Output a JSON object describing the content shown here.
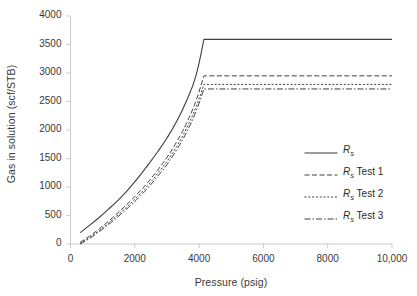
{
  "chart_data": {
    "type": "line",
    "title": "",
    "xlabel": "Pressure (psig)",
    "ylabel": "Gas in solution (scf/STB)",
    "xlim": [
      0,
      10000
    ],
    "ylim": [
      0,
      4000
    ],
    "xticks": [
      0,
      2000,
      4000,
      6000,
      8000,
      10000
    ],
    "xtick_labels": [
      "0",
      "2000",
      "4000",
      "6000",
      "8000",
      "10,000"
    ],
    "yticks": [
      0,
      500,
      1000,
      1500,
      2000,
      2500,
      3000,
      3500,
      4000
    ],
    "ytick_labels": [
      "0",
      "500",
      "1000",
      "1500",
      "2000",
      "2500",
      "3000",
      "3500",
      "4000"
    ],
    "grid": false,
    "legend_position": "center right",
    "line_color": "#3f3f3f",
    "axis_color": "#c9c9c9",
    "series": [
      {
        "name": "Rs",
        "label_main": "R",
        "label_sub": "s",
        "label_suffix": "",
        "style": "solid",
        "bubble_point_pressure": 4150,
        "plateau_value": 3590,
        "x": [
          300,
          600,
          900,
          1200,
          1500,
          1800,
          2100,
          2400,
          2700,
          3000,
          3300,
          3600,
          3900,
          4150,
          5000,
          6000,
          7000,
          8000,
          9000,
          10000
        ],
        "values": [
          200,
          330,
          470,
          620,
          780,
          960,
          1160,
          1380,
          1610,
          1860,
          2150,
          2500,
          2950,
          3590,
          3590,
          3590,
          3590,
          3590,
          3590,
          3590
        ]
      },
      {
        "name": "Rs Test 1",
        "label_main": "R",
        "label_sub": "s",
        "label_suffix": " Test 1",
        "style": "dashed",
        "bubble_point_pressure": 4150,
        "plateau_value": 2950,
        "x": [
          300,
          600,
          900,
          1200,
          1500,
          1800,
          2100,
          2400,
          2700,
          3000,
          3300,
          3600,
          3900,
          4150,
          5000,
          6000,
          7000,
          8000,
          9000,
          10000
        ],
        "values": [
          30,
          140,
          270,
          410,
          560,
          720,
          890,
          1080,
          1290,
          1520,
          1790,
          2110,
          2510,
          2950,
          2950,
          2950,
          2950,
          2950,
          2950,
          2950
        ]
      },
      {
        "name": "Rs Test 2",
        "label_main": "R",
        "label_sub": "s",
        "label_suffix": " Test 2",
        "style": "dotted",
        "bubble_point_pressure": 4150,
        "plateau_value": 2800,
        "x": [
          300,
          600,
          900,
          1200,
          1500,
          1800,
          2100,
          2400,
          2700,
          3000,
          3300,
          3600,
          3900,
          4150,
          5000,
          6000,
          7000,
          8000,
          9000,
          10000
        ],
        "values": [
          10,
          115,
          240,
          375,
          520,
          675,
          840,
          1025,
          1230,
          1450,
          1710,
          2020,
          2400,
          2800,
          2800,
          2800,
          2800,
          2800,
          2800,
          2800
        ]
      },
      {
        "name": "Rs Test 3",
        "label_main": "R",
        "label_sub": "s",
        "label_suffix": " Test 3",
        "style": "dashdot",
        "bubble_point_pressure": 4150,
        "plateau_value": 2720,
        "x": [
          300,
          600,
          900,
          1200,
          1500,
          1800,
          2100,
          2400,
          2700,
          3000,
          3300,
          3600,
          3900,
          4150,
          5000,
          6000,
          7000,
          8000,
          9000,
          10000
        ],
        "values": [
          0,
          100,
          220,
          350,
          490,
          640,
          800,
          980,
          1180,
          1395,
          1650,
          1950,
          2320,
          2720,
          2720,
          2720,
          2720,
          2720,
          2720,
          2720
        ]
      }
    ]
  }
}
